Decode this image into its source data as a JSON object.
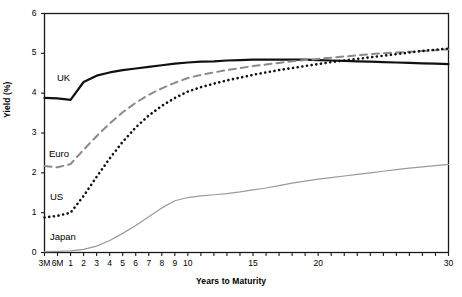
{
  "chart_data": {
    "type": "line",
    "title": "",
    "xlabel": "Years to Maturity",
    "ylabel": "Yield (%)",
    "ylim": [
      0,
      6
    ],
    "yticks": [
      0,
      1,
      2,
      3,
      4,
      5,
      6
    ],
    "xticks_labeled": [
      "3M",
      "6M",
      "1",
      "2",
      "3",
      "4",
      "5",
      "6",
      "7",
      "8",
      "9",
      "10",
      "15",
      "20",
      "30"
    ],
    "x": [
      "3M",
      "6M",
      "1",
      "2",
      "3",
      "4",
      "5",
      "6",
      "7",
      "8",
      "9",
      "10",
      "11",
      "12",
      "13",
      "14",
      "15",
      "16",
      "17",
      "18",
      "19",
      "20",
      "21",
      "22",
      "23",
      "24",
      "25",
      "26",
      "27",
      "28",
      "29",
      "30"
    ],
    "grid": false,
    "legend": "inline-labels",
    "series": [
      {
        "name": "UK",
        "style": "solid",
        "color": "#111111",
        "width": 2.2,
        "values": [
          3.88,
          3.87,
          3.83,
          4.28,
          4.44,
          4.52,
          4.58,
          4.62,
          4.66,
          4.7,
          4.74,
          4.77,
          4.79,
          4.8,
          4.82,
          4.83,
          4.84,
          4.84,
          4.84,
          4.84,
          4.84,
          4.83,
          4.82,
          4.81,
          4.8,
          4.79,
          4.78,
          4.77,
          4.76,
          4.75,
          4.74,
          4.73
        ]
      },
      {
        "name": "Euro",
        "style": "dashed",
        "color": "#8a8a8a",
        "width": 2.0,
        "values": [
          2.17,
          2.14,
          2.22,
          2.58,
          2.92,
          3.24,
          3.52,
          3.76,
          3.96,
          4.12,
          4.26,
          4.38,
          4.46,
          4.52,
          4.58,
          4.63,
          4.68,
          4.72,
          4.76,
          4.8,
          4.83,
          4.86,
          4.89,
          4.92,
          4.95,
          4.98,
          5.0,
          5.02,
          5.04,
          5.06,
          5.08,
          5.1
        ]
      },
      {
        "name": "US",
        "style": "dotted",
        "color": "#111111",
        "width": 2.6,
        "values": [
          0.88,
          0.92,
          1.0,
          1.42,
          1.9,
          2.36,
          2.78,
          3.14,
          3.44,
          3.68,
          3.88,
          4.04,
          4.15,
          4.24,
          4.32,
          4.39,
          4.46,
          4.52,
          4.58,
          4.63,
          4.68,
          4.73,
          4.78,
          4.82,
          4.86,
          4.9,
          4.94,
          4.98,
          5.02,
          5.06,
          5.09,
          5.12
        ]
      },
      {
        "name": "Japan",
        "style": "solid",
        "color": "#9a9a9a",
        "width": 1.2,
        "values": [
          0.02,
          0.03,
          0.04,
          0.08,
          0.16,
          0.3,
          0.48,
          0.68,
          0.9,
          1.12,
          1.3,
          1.38,
          1.42,
          1.45,
          1.48,
          1.52,
          1.57,
          1.62,
          1.68,
          1.74,
          1.79,
          1.84,
          1.88,
          1.92,
          1.96,
          2.0,
          2.04,
          2.08,
          2.12,
          2.15,
          2.18,
          2.21
        ]
      }
    ],
    "series_label_positions": [
      {
        "name": "UK",
        "left": 57,
        "top": 72
      },
      {
        "name": "Euro",
        "left": 49,
        "top": 148
      },
      {
        "name": "US",
        "left": 50,
        "top": 191
      },
      {
        "name": "Japan",
        "left": 50,
        "top": 231
      }
    ]
  }
}
